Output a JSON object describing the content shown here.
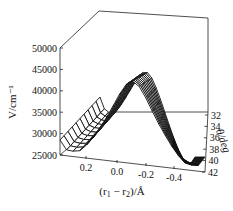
{
  "chart_data": {
    "type": "surface3d",
    "title": "",
    "xlabel": "(r1 − r2)/Å",
    "ylabel": "θ/deg",
    "zlabel": "V/cm⁻¹",
    "x_ticks": [
      "0.2",
      "0.0",
      "-0.2",
      "-0.4"
    ],
    "y_ticks": [
      "32",
      "34",
      "36",
      "38",
      "40",
      "42"
    ],
    "z_ticks": [
      "50000",
      "45000",
      "40000",
      "35000",
      "30000",
      "25000"
    ],
    "xlim": [
      0.4,
      -0.5
    ],
    "ylim": [
      32,
      42
    ],
    "zlim": [
      25000,
      50000
    ],
    "grid": false,
    "legend": null,
    "sample_profile_theta32": {
      "x": [
        0.4,
        0.3,
        0.2,
        0.1,
        0.0,
        -0.1,
        -0.2,
        -0.3,
        -0.4,
        -0.5
      ],
      "v": [
        47000,
        36000,
        28000,
        31000,
        34000,
        31000,
        28000,
        33000,
        42000,
        50000
      ]
    }
  },
  "labels": {
    "z_axis": "V/cm⁻¹",
    "x_axis_prefix": "(r",
    "x_axis_sub1": "1",
    "x_axis_mid": " − r",
    "x_axis_sub2": "2",
    "x_axis_suffix": ")/Å",
    "y_axis": "θ/deg"
  }
}
